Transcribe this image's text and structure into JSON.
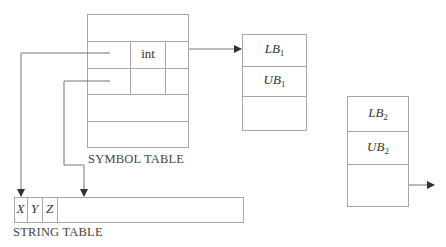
{
  "symbol_table": {
    "label": "SYMBOL TABLE",
    "type_cell": "int",
    "rows": 5
  },
  "string_table": {
    "label": "STRING TABLE",
    "chars": [
      "X",
      "Y",
      "Z"
    ]
  },
  "bounds_block_1": {
    "lower": {
      "base": "LB",
      "sub": "1"
    },
    "upper": {
      "base": "UB",
      "sub": "1"
    }
  },
  "bounds_block_2": {
    "lower": {
      "base": "LB",
      "sub": "2"
    },
    "upper": {
      "base": "UB",
      "sub": "2"
    }
  },
  "colors": {
    "line": "#a8a8a8",
    "arrow": "#333333",
    "text": "#333333"
  }
}
